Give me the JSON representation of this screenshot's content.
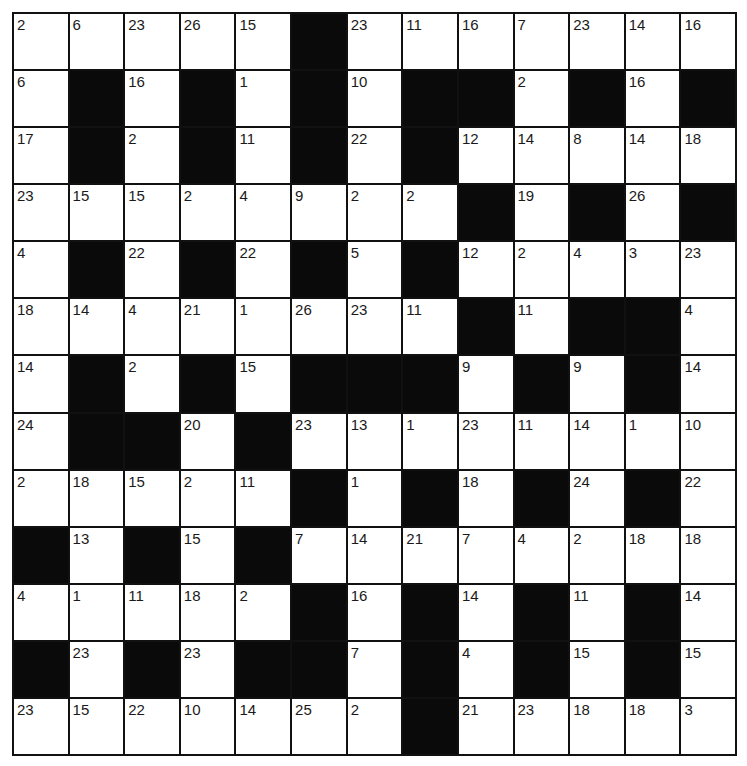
{
  "puzzle": {
    "type": "codeword",
    "rows": 13,
    "cols": 13,
    "black_marker": "#",
    "colors": {
      "cell": "#ffffff",
      "block": "#0a0a0a",
      "line": "#111111",
      "text": "#1a1a1a"
    },
    "grid": [
      [
        "2",
        "6",
        "23",
        "26",
        "15",
        "#",
        "23",
        "11",
        "16",
        "7",
        "23",
        "14",
        "16"
      ],
      [
        "6",
        "#",
        "16",
        "#",
        "1",
        "#",
        "10",
        "#",
        "#",
        "2",
        "#",
        "16",
        "#"
      ],
      [
        "17",
        "#",
        "2",
        "#",
        "11",
        "#",
        "22",
        "#",
        "12",
        "14",
        "8",
        "14",
        "18"
      ],
      [
        "23",
        "15",
        "15",
        "2",
        "4",
        "9",
        "2",
        "2",
        "#",
        "19",
        "#",
        "26",
        "#"
      ],
      [
        "4",
        "#",
        "22",
        "#",
        "22",
        "#",
        "5",
        "#",
        "12",
        "2",
        "4",
        "3",
        "23"
      ],
      [
        "18",
        "14",
        "4",
        "21",
        "1",
        "26",
        "23",
        "11",
        "#",
        "11",
        "#",
        "#",
        "4"
      ],
      [
        "14",
        "#",
        "2",
        "#",
        "15",
        "#",
        "#",
        "#",
        "9",
        "#",
        "9",
        "#",
        "14"
      ],
      [
        "24",
        "#",
        "#",
        "20",
        "#",
        "23",
        "13",
        "1",
        "23",
        "11",
        "14",
        "1",
        "10"
      ],
      [
        "2",
        "18",
        "15",
        "2",
        "11",
        "#",
        "1",
        "#",
        "18",
        "#",
        "24",
        "#",
        "22"
      ],
      [
        "#",
        "13",
        "#",
        "15",
        "#",
        "7",
        "14",
        "21",
        "7",
        "4",
        "2",
        "18",
        "18"
      ],
      [
        "4",
        "1",
        "11",
        "18",
        "2",
        "#",
        "16",
        "#",
        "14",
        "#",
        "11",
        "#",
        "14"
      ],
      [
        "#",
        "23",
        "#",
        "23",
        "#",
        "#",
        "7",
        "#",
        "4",
        "#",
        "15",
        "#",
        "15"
      ],
      [
        "23",
        "15",
        "22",
        "10",
        "14",
        "25",
        "2",
        "#",
        "21",
        "23",
        "18",
        "18",
        "3"
      ]
    ]
  }
}
